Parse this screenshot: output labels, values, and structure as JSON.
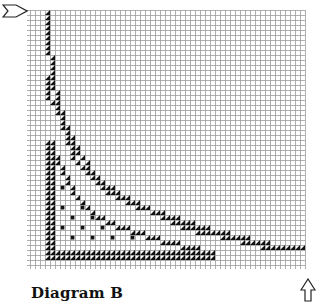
{
  "caption": "Diagram B",
  "grid": {
    "origin_x": 30,
    "origin_y": 10,
    "cell": 5,
    "cols": 55,
    "rows": 51,
    "line_color": "#9a9a9a",
    "mark_color": "#111111"
  },
  "arrows": {
    "top_left": {
      "direction": "right",
      "x": 2,
      "y": 4
    },
    "bottom_right": {
      "direction": "up",
      "x": 300,
      "y": 279
    }
  },
  "curves": [
    {
      "name": "outer",
      "points": [
        [
          3,
          0
        ],
        [
          3,
          8
        ],
        [
          4,
          9
        ],
        [
          4,
          15
        ],
        [
          5,
          16
        ],
        [
          5,
          19
        ],
        [
          6,
          20
        ],
        [
          6,
          23
        ],
        [
          7,
          24
        ],
        [
          7,
          26
        ],
        [
          8,
          27
        ],
        [
          8,
          29
        ],
        [
          9,
          30
        ],
        [
          10,
          31
        ],
        [
          11,
          32
        ],
        [
          12,
          33
        ],
        [
          13,
          34
        ],
        [
          14,
          35
        ],
        [
          16,
          36
        ],
        [
          18,
          37
        ],
        [
          20,
          38
        ],
        [
          22,
          39
        ],
        [
          25,
          40
        ],
        [
          28,
          41
        ],
        [
          31,
          42
        ],
        [
          34,
          43
        ],
        [
          38,
          44
        ],
        [
          42,
          45
        ],
        [
          46,
          46
        ],
        [
          50,
          47
        ],
        [
          54,
          47
        ]
      ]
    },
    {
      "name": "middle",
      "points": [
        [
          3,
          13
        ],
        [
          3,
          17
        ],
        [
          4,
          18
        ],
        [
          5,
          20
        ],
        [
          6,
          22
        ],
        [
          7,
          24
        ],
        [
          8,
          26
        ],
        [
          9,
          28
        ],
        [
          10,
          29
        ],
        [
          11,
          31
        ],
        [
          12,
          32
        ],
        [
          14,
          34
        ],
        [
          16,
          35
        ],
        [
          18,
          37
        ],
        [
          21,
          38
        ],
        [
          24,
          40
        ],
        [
          27,
          41
        ],
        [
          31,
          43
        ],
        [
          35,
          44
        ],
        [
          40,
          45
        ],
        [
          44,
          46
        ],
        [
          48,
          47
        ]
      ]
    },
    {
      "name": "inner",
      "points": [
        [
          3,
          26
        ],
        [
          4,
          28
        ],
        [
          5,
          30
        ],
        [
          6,
          32
        ],
        [
          7,
          34
        ],
        [
          8,
          36
        ],
        [
          9,
          37
        ],
        [
          10,
          38
        ],
        [
          12,
          40
        ],
        [
          14,
          41
        ],
        [
          16,
          42
        ],
        [
          18,
          43
        ],
        [
          21,
          44
        ],
        [
          24,
          45
        ],
        [
          28,
          46
        ],
        [
          32,
          47
        ],
        [
          36,
          48
        ]
      ]
    }
  ],
  "wall": {
    "left_cols": [
      3,
      4
    ],
    "bottom_rows": [
      48,
      49
    ],
    "from_row": 26,
    "to_col": 36
  },
  "dots": {
    "rows": [
      31,
      33,
      35,
      37,
      39,
      41,
      43,
      45
    ],
    "row_start_col": [
      6,
      6,
      6,
      6,
      6,
      6,
      6,
      6
    ],
    "step": 4
  }
}
